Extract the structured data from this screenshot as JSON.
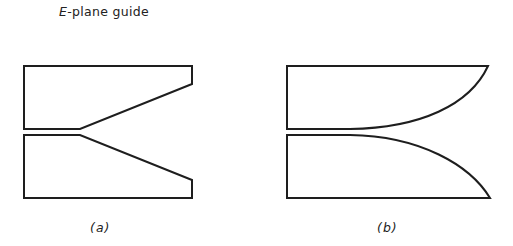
{
  "title": {
    "prefix": "E",
    "suffix": "-plane guide"
  },
  "figures": [
    {
      "id": "a",
      "caption": "(a)",
      "description": "Linear taper (straight-line flare) E-plane guide transition"
    },
    {
      "id": "b",
      "caption": "(b)",
      "description": "Curved (exponential-like) flare E-plane guide transition"
    }
  ],
  "colors": {
    "stroke": "#1e1e1e",
    "background": "#ffffff"
  }
}
